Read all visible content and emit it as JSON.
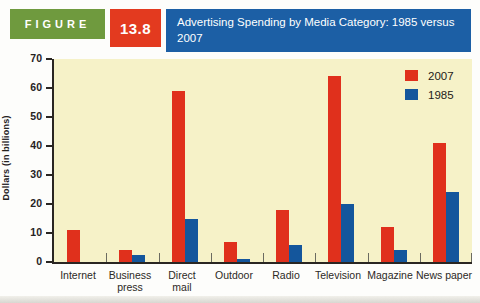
{
  "header": {
    "figure_label": "FIGURE",
    "figure_number": "13.8",
    "title": "Advertising Spending by Media Category: 1985 versus 2007",
    "colors": {
      "label_green": "#6f9a3e",
      "number_red": "#e33a1f",
      "title_blue": "#1c5fa5",
      "text": "#ffffff"
    }
  },
  "chart_data": {
    "type": "bar",
    "title": "Advertising Spending by Media Category: 1985 versus 2007",
    "categories": [
      "Internet",
      "Business press",
      "Direct mail",
      "Outdoor",
      "Radio",
      "Television",
      "Magazine",
      "News paper"
    ],
    "category_lines": [
      [
        "Internet"
      ],
      [
        "Business",
        "press"
      ],
      [
        "Direct",
        "mail"
      ],
      [
        "Outdoor"
      ],
      [
        "Radio"
      ],
      [
        "Television"
      ],
      [
        "Magazine"
      ],
      [
        "News paper"
      ]
    ],
    "series": [
      {
        "name": "2007",
        "color": "#e0301c",
        "values": [
          11,
          4,
          59,
          7,
          18,
          64,
          12,
          41
        ]
      },
      {
        "name": "1985",
        "color": "#14569c",
        "values": [
          0,
          2.5,
          15,
          1,
          6,
          20,
          4,
          24
        ]
      }
    ],
    "xlabel": "",
    "ylabel": "Dollars (in billions)",
    "ylim": [
      0,
      70
    ],
    "yticks": [
      0,
      10,
      20,
      30,
      40,
      50,
      60,
      70
    ],
    "grid": false,
    "legend_position": "top-right",
    "plot_bg": "#f6f2c8"
  }
}
